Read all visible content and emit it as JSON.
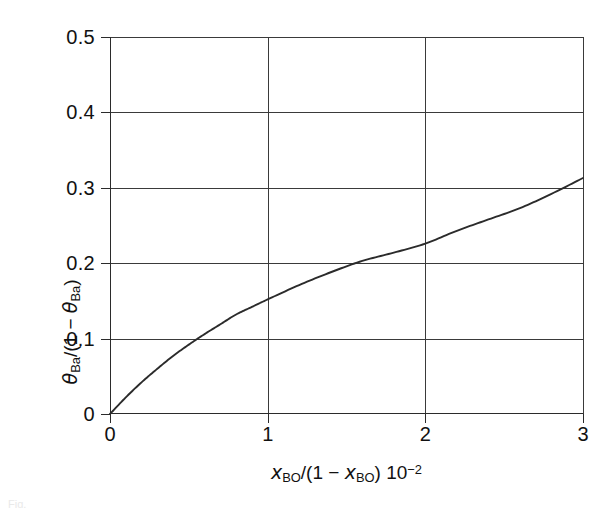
{
  "chart_data": {
    "type": "line",
    "title": "",
    "subtitle": "",
    "xlabel": "x_BO/(1 - x_BO) 10^-2",
    "ylabel": "theta_Ba/(1 - theta_Ba)",
    "xlim": [
      0,
      3
    ],
    "ylim": [
      0,
      0.5
    ],
    "grid": true,
    "legend": null,
    "xticks": [
      0,
      1,
      2,
      3
    ],
    "yticks": [
      0,
      0.1,
      0.2,
      0.3,
      0.4,
      0.5
    ],
    "xtick_labels": [
      "0",
      "1",
      "2",
      "3"
    ],
    "ytick_labels": [
      "0",
      "0.1",
      "0.2",
      "0.3",
      "0.4",
      "0.5"
    ],
    "series": [
      {
        "name": "isotherm",
        "color": "#2b2b2b",
        "x": [
          0.0,
          0.1,
          0.2,
          0.3,
          0.4,
          0.5,
          0.6,
          0.7,
          0.8,
          0.9,
          1.0,
          1.2,
          1.4,
          1.6,
          1.8,
          2.0,
          2.2,
          2.4,
          2.6,
          2.8,
          3.0
        ],
        "y": [
          0.0,
          0.022,
          0.042,
          0.06,
          0.077,
          0.092,
          0.106,
          0.119,
          0.132,
          0.142,
          0.152,
          0.171,
          0.188,
          0.203,
          0.214,
          0.226,
          0.243,
          0.258,
          0.273,
          0.292,
          0.313
        ]
      }
    ],
    "annotations": [
      {
        "text": "curve crosses y=0.1 at x≈0.70"
      },
      {
        "text": "curve crosses y=0.2 at x≈1.62"
      },
      {
        "text": "curve crosses y=0.3 at x≈2.78"
      }
    ]
  },
  "axes": {
    "y_title": {
      "theta": "θ",
      "sub1": "Ba",
      "mid": "/(1 − ",
      "theta2": "θ",
      "sub2": "Ba",
      "close": ")"
    },
    "x_title": {
      "x1": "x",
      "sub1": "BO",
      "mid": "/(1 − ",
      "x2": "x",
      "sub2": "BO",
      "close": ") 10",
      "exp": "−2"
    },
    "y_ticks": [
      "0.5",
      "0.4",
      "0.3",
      "0.2",
      "0.1",
      "0"
    ],
    "x_ticks": [
      "0",
      "1",
      "2",
      "3"
    ]
  },
  "caption": {
    "text": "Fig."
  }
}
